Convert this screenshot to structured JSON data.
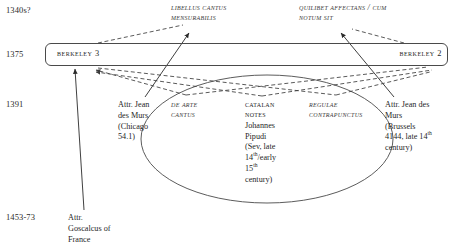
{
  "diagram": {
    "type": "stemma",
    "timeline_dates": [
      {
        "id": "d1340",
        "label": "1340s?"
      },
      {
        "id": "d1375",
        "label": "1375"
      },
      {
        "id": "d1391",
        "label": "1391"
      },
      {
        "id": "d1453",
        "label": "1453-73"
      }
    ],
    "exemplar_titles": [
      {
        "id": "libellus",
        "label": "Libellus cantus mensurabilis"
      },
      {
        "id": "quilibet",
        "label": "Quilibet affectans / Cum notum sit"
      }
    ],
    "manuscript_box": {
      "left_label": "Berkeley 3",
      "right_label": "Berkeley 2"
    },
    "witnesses": [
      {
        "id": "chicago",
        "lines": [
          "Attr. Jean",
          "des Murs",
          "(Chicago",
          "54.1)"
        ],
        "style": "plain"
      },
      {
        "id": "de-arte-cantus",
        "lines": [
          "De arte",
          "cantus"
        ],
        "style": "treatise"
      },
      {
        "id": "catalan-notes",
        "heading": [
          "Catalan",
          "Notes"
        ],
        "lines": [
          "Johannes",
          "Pipudi",
          "(Sev, late",
          "14th/early",
          "15th",
          "century)"
        ],
        "style": "smallcaps-plain"
      },
      {
        "id": "regulae-contrapunctus",
        "lines": [
          "Regulae",
          "contrapunctus"
        ],
        "style": "treatise"
      },
      {
        "id": "brussels",
        "lines": [
          "Attr. Jean des",
          "Murs",
          "(Brussels",
          "4144, late 14th",
          "century)"
        ],
        "style": "plain"
      },
      {
        "id": "goscalcus",
        "lines": [
          "Attr.",
          "Goscalcus of",
          "France"
        ],
        "style": "plain"
      }
    ],
    "grouping_ellipse": {
      "label": "ellipse-grouping-de-arte-catalan-regulae",
      "cx": 267,
      "cy": 139,
      "rx": 126,
      "ry": 64
    },
    "colors": {
      "ink": "#1f1f1f",
      "rule": "#4a4a4a",
      "dashed": "#3c3c3c"
    }
  }
}
